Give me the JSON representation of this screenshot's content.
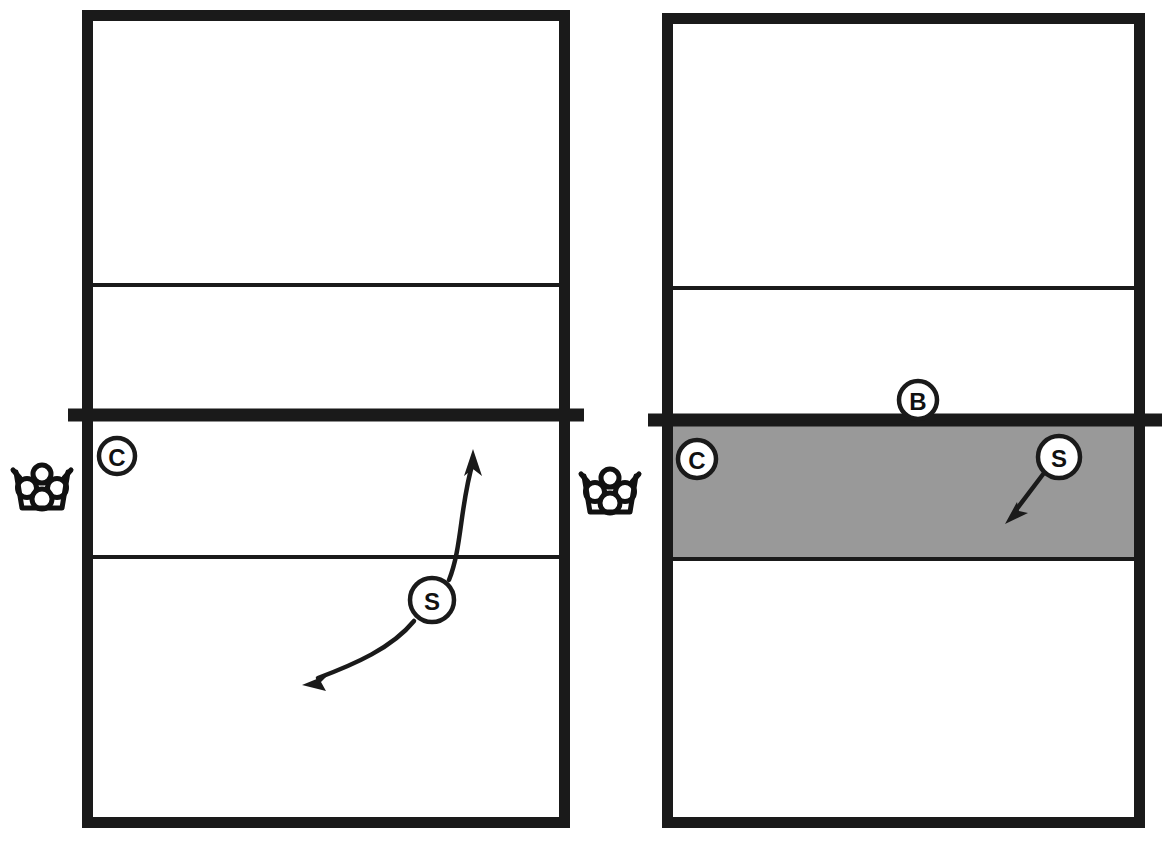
{
  "figure": {
    "type": "volleyball-court-drill-diagram",
    "panel_count": 2,
    "background_color": "#ffffff",
    "line_color": "#1a1a1a",
    "shade_color": "#999999"
  },
  "panels": [
    {
      "id": "left-panel",
      "name": "left-court-diagram",
      "court": {
        "x": 82,
        "y": 10,
        "width": 488,
        "height": 818,
        "far_attack_line_y": 285,
        "net_line_y": 415,
        "near_attack_line_y": 557,
        "net_overhang": 14
      },
      "shaded_zone": null,
      "ball_cart": {
        "name": "ball-cart-icon",
        "label": "ball-cart",
        "x": 42,
        "y": 488,
        "ball_count": 4
      },
      "tokens": [
        {
          "id": "left-coach",
          "label": "C",
          "name": "coach-marker",
          "x": 117,
          "y": 456,
          "r": 18
        },
        {
          "id": "left-setter",
          "label": "S",
          "name": "setter-marker",
          "x": 432,
          "y": 600,
          "r": 22
        }
      ],
      "arrows": [
        {
          "id": "left-setter-approach",
          "name": "setter-approach-arrow",
          "style": "curved",
          "direction": "up-right",
          "path": "M 449 580 C 462 548 460 505 473 462",
          "head": "M 473 451 l 9 22 l -9 -6 l -9 6 z",
          "head_rotation": 0
        },
        {
          "id": "left-setter-recover",
          "name": "setter-recovery-arrow",
          "style": "curved",
          "direction": "down-left",
          "path": "M 414 621 C 392 648 355 664 316 679",
          "head": "M 303 684 l 22 -9 l -6 9 l 6 9 z",
          "head_rotation": 0
        }
      ]
    },
    {
      "id": "right-panel",
      "name": "right-court-diagram",
      "court": {
        "x": 662,
        "y": 13,
        "width": 483,
        "height": 815,
        "far_attack_line_y": 288,
        "net_line_y": 420,
        "near_attack_line_y": 560,
        "net_overhang": 17
      },
      "shaded_zone": {
        "name": "front-zone-shading",
        "label": "shaded-front-zone",
        "x": 668,
        "y": 426,
        "width": 471,
        "height": 133,
        "color": "#999999"
      },
      "ball_cart": {
        "name": "ball-cart-icon",
        "label": "ball-cart",
        "x": 610,
        "y": 492,
        "ball_count": 4
      },
      "tokens": [
        {
          "id": "right-blocker",
          "label": "B",
          "name": "blocker-marker",
          "x": 918,
          "y": 400,
          "r": 19
        },
        {
          "id": "right-coach",
          "label": "C",
          "name": "coach-marker",
          "x": 697,
          "y": 459,
          "r": 19
        },
        {
          "id": "right-setter",
          "label": "S",
          "name": "setter-marker",
          "x": 1059,
          "y": 457,
          "r": 21
        }
      ],
      "arrows": [
        {
          "id": "right-setter-move",
          "name": "setter-movement-arrow",
          "style": "straight",
          "direction": "down-left",
          "path": "M 1044 473 L 1014 512",
          "head": "M 1006 522 l 19 -4 l -7 -5 l 1 -9 z",
          "head_rotation": 0
        }
      ]
    }
  ],
  "legend": {
    "marker_meanings": [
      {
        "code": "C",
        "meaning": "C"
      },
      {
        "code": "S",
        "meaning": "S"
      },
      {
        "code": "B",
        "meaning": "B"
      }
    ]
  }
}
